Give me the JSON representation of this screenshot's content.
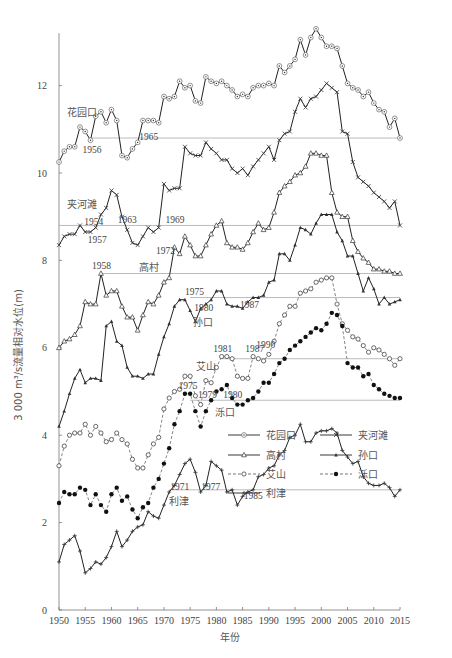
{
  "chart_data": {
    "type": "line",
    "title": "",
    "xlabel": "年份",
    "ylabel": "3 000 m³/s流量相对水位(m)",
    "xlim": [
      1950,
      2015
    ],
    "ylim": [
      0,
      13.5
    ],
    "xticks": [
      1950,
      1955,
      1960,
      1965,
      1970,
      1975,
      1980,
      1985,
      1990,
      1995,
      2000,
      2005,
      2010,
      2015
    ],
    "yticks": [
      0,
      2,
      4,
      6,
      8,
      10,
      12
    ],
    "grid": false,
    "legend_position": "lower right (inside)",
    "x": [
      1950,
      1951,
      1952,
      1953,
      1954,
      1955,
      1956,
      1957,
      1958,
      1959,
      1960,
      1961,
      1962,
      1963,
      1964,
      1965,
      1966,
      1967,
      1968,
      1969,
      1970,
      1971,
      1972,
      1973,
      1974,
      1975,
      1976,
      1977,
      1978,
      1979,
      1980,
      1981,
      1982,
      1983,
      1984,
      1985,
      1986,
      1987,
      1988,
      1989,
      1990,
      1991,
      1992,
      1993,
      1994,
      1995,
      1996,
      1997,
      1998,
      1999,
      2000,
      2001,
      2002,
      2003,
      2004,
      2005,
      2006,
      2007,
      2008,
      2009,
      2010,
      2011,
      2012,
      2013,
      2014,
      2015
    ],
    "series": [
      {
        "name": "花园口",
        "style": "solid",
        "marker": "open-circle-dot",
        "values": [
          10.25,
          10.5,
          10.6,
          10.6,
          11.05,
          10.95,
          10.75,
          11.3,
          11.4,
          11.15,
          11.45,
          11.2,
          10.4,
          10.35,
          10.55,
          10.7,
          11.2,
          11.2,
          11.2,
          11.15,
          11.75,
          11.7,
          11.75,
          12.1,
          11.95,
          12.0,
          11.65,
          11.6,
          12.2,
          12.1,
          12.05,
          12.1,
          12.0,
          11.9,
          11.75,
          11.8,
          11.75,
          11.95,
          12.0,
          12.0,
          12.05,
          12.0,
          12.45,
          12.3,
          12.45,
          12.6,
          13.05,
          12.7,
          13.1,
          13.3,
          13.1,
          12.9,
          12.9,
          12.85,
          12.45,
          12.05,
          11.95,
          11.9,
          11.75,
          11.85,
          11.6,
          11.45,
          11.4,
          11.05,
          11.25,
          10.8
        ],
        "reference_line": {
          "value": 10.8,
          "from_year": 1956,
          "annotations": [
            "1956",
            "1965"
          ]
        }
      },
      {
        "name": "夹河滩",
        "style": "solid",
        "marker": "x",
        "values": [
          8.35,
          8.55,
          8.6,
          8.6,
          8.8,
          8.65,
          8.65,
          8.75,
          9.05,
          9.2,
          9.6,
          9.5,
          9.0,
          8.7,
          8.4,
          8.35,
          8.55,
          8.75,
          8.65,
          8.75,
          9.75,
          9.6,
          9.65,
          9.65,
          10.6,
          10.45,
          10.4,
          10.4,
          10.7,
          10.55,
          10.45,
          10.3,
          10.3,
          10.1,
          10.0,
          10.1,
          9.95,
          10.15,
          10.3,
          10.45,
          10.6,
          10.3,
          10.75,
          10.9,
          10.95,
          11.4,
          11.7,
          11.5,
          11.7,
          11.75,
          11.9,
          12.05,
          11.95,
          11.85,
          10.95,
          10.9,
          10.25,
          9.9,
          9.8,
          9.7,
          9.55,
          9.45,
          9.35,
          9.2,
          9.35,
          8.8
        ],
        "reference_line": {
          "value": 8.8,
          "from_year": 1950,
          "annotations": [
            "1954",
            "1957",
            "1963",
            "1969"
          ]
        }
      },
      {
        "name": "高村",
        "style": "solid",
        "marker": "open-triangle",
        "values": [
          6.0,
          6.15,
          6.2,
          6.3,
          6.5,
          7.05,
          7.0,
          7.0,
          7.7,
          7.2,
          7.3,
          7.3,
          6.95,
          6.7,
          6.7,
          6.4,
          6.75,
          7.05,
          7.0,
          7.2,
          7.5,
          7.6,
          8.3,
          8.15,
          8.55,
          8.35,
          8.1,
          8.1,
          8.35,
          8.6,
          8.8,
          8.9,
          8.4,
          8.3,
          8.3,
          8.25,
          8.4,
          8.65,
          8.85,
          8.7,
          8.75,
          9.1,
          9.55,
          9.7,
          9.8,
          9.95,
          10.0,
          10.15,
          10.45,
          10.45,
          10.4,
          10.4,
          9.55,
          9.1,
          9.0,
          9.0,
          8.45,
          8.2,
          8.05,
          7.95,
          7.8,
          7.8,
          7.75,
          7.75,
          7.7,
          7.7
        ],
        "reference_line": {
          "value": 7.7,
          "from_year": 1958,
          "annotations": [
            "1958",
            "1972"
          ]
        }
      },
      {
        "name": "孙口",
        "style": "solid",
        "marker": "filled-triangle",
        "values": [
          4.2,
          4.55,
          4.95,
          5.3,
          5.5,
          5.2,
          5.3,
          5.3,
          5.25,
          6.5,
          6.6,
          6.15,
          6.05,
          5.55,
          5.35,
          5.35,
          5.3,
          5.4,
          5.4,
          5.85,
          6.25,
          6.55,
          6.95,
          7.1,
          7.1,
          6.85,
          6.6,
          6.9,
          7.0,
          7.1,
          7.3,
          7.3,
          7.0,
          6.95,
          6.95,
          6.9,
          7.05,
          7.15,
          7.15,
          7.2,
          7.5,
          7.55,
          8.15,
          8.15,
          8.0,
          8.35,
          8.75,
          8.7,
          8.6,
          8.85,
          9.05,
          9.05,
          9.05,
          8.65,
          8.45,
          8.1,
          8.1,
          7.7,
          7.3,
          7.6,
          7.35,
          7.0,
          7.15,
          7.0,
          7.05,
          7.1
        ],
        "reference_line": {
          "value": 7.15,
          "from_year": 1975,
          "annotations": [
            "1975",
            "1980",
            "1987"
          ]
        }
      },
      {
        "name": "艾山",
        "style": "dashed",
        "marker": "open-circle",
        "values": [
          3.3,
          3.75,
          4.0,
          4.05,
          4.05,
          4.25,
          4.0,
          4.2,
          4.05,
          3.85,
          3.9,
          4.05,
          3.9,
          3.8,
          3.45,
          3.25,
          3.25,
          3.55,
          3.8,
          3.95,
          4.6,
          4.85,
          5.0,
          5.05,
          5.35,
          5.35,
          4.9,
          4.7,
          5.25,
          5.2,
          5.55,
          5.8,
          5.8,
          5.75,
          5.35,
          5.3,
          5.3,
          5.8,
          5.75,
          5.7,
          5.85,
          6.15,
          6.55,
          6.75,
          6.95,
          6.95,
          7.25,
          7.3,
          7.35,
          7.5,
          7.55,
          7.6,
          7.6,
          7.0,
          6.55,
          6.4,
          6.25,
          6.2,
          6.05,
          5.9,
          6.0,
          5.95,
          5.85,
          5.75,
          5.6,
          5.75
        ],
        "reference_line": {
          "value": 5.75,
          "from_year": 1981,
          "annotations": [
            "艾山",
            "1981",
            "1987",
            "1990"
          ]
        }
      },
      {
        "name": "泺口",
        "style": "dashed",
        "marker": "filled-circle",
        "values": [
          2.45,
          2.7,
          2.65,
          2.65,
          2.8,
          2.75,
          2.4,
          2.65,
          2.4,
          2.25,
          2.65,
          2.8,
          2.5,
          2.6,
          2.3,
          2.1,
          2.35,
          2.45,
          2.8,
          3.0,
          3.35,
          3.7,
          4.25,
          4.55,
          4.95,
          4.95,
          4.55,
          4.2,
          4.55,
          4.8,
          5.0,
          5.05,
          5.15,
          4.85,
          4.7,
          4.7,
          4.8,
          4.85,
          5.0,
          5.2,
          5.2,
          5.4,
          5.65,
          5.75,
          5.95,
          6.05,
          6.15,
          6.25,
          6.35,
          6.45,
          6.4,
          6.55,
          6.8,
          6.75,
          6.5,
          5.65,
          5.55,
          5.55,
          5.35,
          5.4,
          5.15,
          5.05,
          4.95,
          4.9,
          4.85,
          4.85
        ],
        "reference_line": {
          "value": 4.8,
          "from_year": 1975,
          "annotations": [
            "1975",
            "1979",
            "1980",
            "泺口"
          ]
        }
      },
      {
        "name": "利津",
        "style": "solid",
        "marker": "plus",
        "values": [
          1.1,
          1.5,
          1.6,
          1.7,
          1.35,
          0.85,
          0.95,
          1.1,
          1.05,
          1.2,
          1.45,
          1.8,
          1.45,
          1.6,
          1.8,
          1.9,
          1.95,
          2.25,
          2.15,
          2.1,
          2.4,
          2.7,
          2.85,
          3.1,
          3.35,
          3.45,
          3.15,
          2.7,
          2.85,
          3.4,
          3.3,
          3.2,
          2.7,
          2.75,
          2.4,
          2.6,
          2.7,
          2.75,
          3.05,
          3.1,
          3.25,
          3.3,
          3.55,
          3.65,
          3.95,
          4.0,
          4.25,
          3.85,
          3.85,
          4.05,
          4.1,
          4.1,
          4.15,
          4.05,
          3.65,
          3.5,
          3.35,
          3.4,
          3.05,
          2.9,
          2.85,
          2.85,
          2.9,
          2.8,
          2.6,
          2.75
        ],
        "reference_line": {
          "value": 2.75,
          "from_year": 1971,
          "annotations": [
            "1971",
            "1977",
            "1985",
            "利津"
          ]
        }
      }
    ]
  },
  "axes": {
    "xlabel": "年份",
    "ylabel": "3 000 m³/s流量相对水位(m)"
  },
  "legend": [
    {
      "label": "花园口",
      "marker": "open-circle-dot",
      "style": "solid"
    },
    {
      "label": "夹河滩",
      "marker": "x",
      "style": "solid"
    },
    {
      "label": "高村",
      "marker": "open-triangle",
      "style": "solid"
    },
    {
      "label": "孙口",
      "marker": "filled-triangle",
      "style": "solid"
    },
    {
      "label": "艾山",
      "marker": "open-circle",
      "style": "dashed"
    },
    {
      "label": "泺口",
      "marker": "filled-circle",
      "style": "dashed"
    },
    {
      "label": "利津",
      "marker": "plus",
      "style": "solid"
    }
  ],
  "annotations": [
    {
      "text": "花园口",
      "x": 1951.5,
      "y": 11.3,
      "cls": "lbl"
    },
    {
      "text": "1956",
      "x": 1954.5,
      "y": 10.45,
      "cls": "ann"
    },
    {
      "text": "1965",
      "x": 1965.3,
      "y": 10.75,
      "cls": "ann"
    },
    {
      "text": "夹河滩",
      "x": 1951.5,
      "y": 9.2,
      "cls": "lbl"
    },
    {
      "text": "1954",
      "x": 1954.8,
      "y": 8.8,
      "cls": "ann"
    },
    {
      "text": "1957",
      "x": 1955.5,
      "y": 8.4,
      "cls": "ann"
    },
    {
      "text": "1963",
      "x": 1961.2,
      "y": 8.85,
      "cls": "ann"
    },
    {
      "text": "1969",
      "x": 1970.3,
      "y": 8.85,
      "cls": "ann"
    },
    {
      "text": "1972",
      "x": 1968.5,
      "y": 8.15,
      "cls": "ann"
    },
    {
      "text": "1958",
      "x": 1956.3,
      "y": 7.8,
      "cls": "ann"
    },
    {
      "text": "高村",
      "x": 1965.3,
      "y": 7.75,
      "cls": "lbl"
    },
    {
      "text": "1975",
      "x": 1974.0,
      "y": 7.2,
      "cls": "ann"
    },
    {
      "text": "1980",
      "x": 1975.8,
      "y": 6.85,
      "cls": "ann"
    },
    {
      "text": "1987",
      "x": 1984.5,
      "y": 6.9,
      "cls": "ann"
    },
    {
      "text": "孙口",
      "x": 1975.5,
      "y": 6.5,
      "cls": "lbl"
    },
    {
      "text": "1990",
      "x": 1987.6,
      "y": 6.0,
      "cls": "ann"
    },
    {
      "text": "艾山",
      "x": 1976.2,
      "y": 5.5,
      "cls": "lbl"
    },
    {
      "text": "1981",
      "x": 1979.4,
      "y": 5.9,
      "cls": "ann"
    },
    {
      "text": "1987",
      "x": 1985.5,
      "y": 5.9,
      "cls": "ann"
    },
    {
      "text": "1975",
      "x": 1972.8,
      "y": 5.05,
      "cls": "ann"
    },
    {
      "text": "1979",
      "x": 1976.5,
      "y": 4.85,
      "cls": "ann"
    },
    {
      "text": "1980",
      "x": 1981.3,
      "y": 4.85,
      "cls": "ann"
    },
    {
      "text": "泺口",
      "x": 1979.8,
      "y": 4.45,
      "cls": "lbl"
    },
    {
      "text": "1971",
      "x": 1971.2,
      "y": 2.75,
      "cls": "ann"
    },
    {
      "text": "1977",
      "x": 1977.1,
      "y": 2.75,
      "cls": "ann"
    },
    {
      "text": "1985",
      "x": 1985.2,
      "y": 2.55,
      "cls": "ann"
    },
    {
      "text": "利津",
      "x": 1971.0,
      "y": 2.4,
      "cls": "lbl"
    }
  ],
  "caption": "图 2-17  黄河下游主要站历年 3 000 m³/s 流量水位变化过程"
}
